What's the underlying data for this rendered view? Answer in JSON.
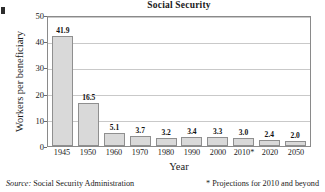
{
  "chart_data": {
    "type": "bar",
    "title": "Social Security",
    "xlabel": "Year",
    "ylabel": "Workers per beneficiary",
    "categories": [
      "1945",
      "1950",
      "1960",
      "1970",
      "1980",
      "1990",
      "2000",
      "2010*",
      "2020",
      "2050"
    ],
    "values": [
      41.9,
      16.5,
      5.1,
      3.7,
      3.2,
      3.4,
      3.3,
      3.0,
      2.4,
      2.0
    ],
    "data_labels": [
      "41.9",
      "16.5",
      "5.1",
      "3.7",
      "3.2",
      "3.4",
      "3.3",
      "3.0",
      "2.4",
      "2.0"
    ],
    "ylim": [
      0,
      50
    ],
    "yticks": [
      0,
      10,
      20,
      30,
      40,
      50
    ],
    "ytick_labels": [
      "0",
      "10",
      "20",
      "30",
      "40",
      "50"
    ],
    "grid": "horizontal",
    "legend": "none",
    "bar_fill": "#d9d9d9",
    "bar_border": "#8f8f8f",
    "grid_color": "#c9c9c9",
    "axis_color": "#8a8a8a"
  },
  "footer": {
    "source_word": "Source:",
    "source_text": " Social Security Administration",
    "note": "* Projections for 2010 and beyond"
  }
}
